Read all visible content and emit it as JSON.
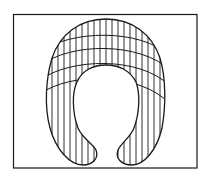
{
  "figure": {
    "stroke_color": "#1a1a1a",
    "background": "#ffffff",
    "frame": {
      "x": 13,
      "y": 14,
      "width": 184,
      "height": 154
    },
    "vertical_hatch_spacing": 6,
    "cross_band_count": 4
  }
}
